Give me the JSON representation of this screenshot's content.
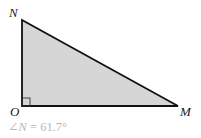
{
  "diagram": {
    "type": "right-triangle",
    "vertices": {
      "N": {
        "label": "N",
        "x": 22,
        "y": 20
      },
      "O": {
        "label": "O",
        "x": 22,
        "y": 106
      },
      "M": {
        "label": "M",
        "x": 178,
        "y": 106
      }
    },
    "right_angle_at": "O",
    "fill_color": "#d6d6d6",
    "stroke_color": "#111111"
  },
  "labels": {
    "N": "N",
    "O": "O",
    "M": "M"
  },
  "caption": {
    "angle_symbol": "∠",
    "vertex": "N",
    "equals": " = ",
    "value": "61.7°",
    "color": "#b8b8b8"
  }
}
